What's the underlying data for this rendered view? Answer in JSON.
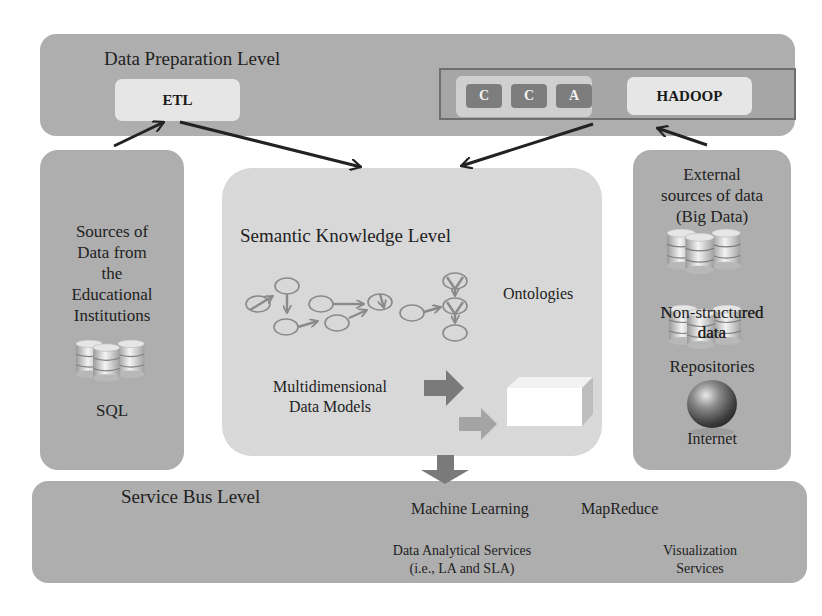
{
  "diagram": {
    "data_preparation": {
      "title": "Data Preparation Level",
      "etl_label": "ETL",
      "cca_chips": [
        "C",
        "C",
        "A"
      ],
      "hadoop_label": "HADOOP"
    },
    "left_source": {
      "title_lines": [
        "Sources of",
        "Data from",
        "the",
        "Educational",
        "Institutions"
      ],
      "icon": "database-stack-icon",
      "label": "SQL"
    },
    "semantic": {
      "title": "Semantic Knowledge Level",
      "ontologies_label": "Ontologies",
      "ontology_icon": "ontology-graph-icon",
      "models_lines": [
        "Multidimensional",
        "Data Models"
      ],
      "cube_icon": "data-cube-icon"
    },
    "right_source": {
      "title_lines": [
        "External",
        "sources of data",
        "(Big Data)"
      ],
      "items": [
        {
          "icon": "database-stack-icon",
          "label_lines": [
            "Non-structured",
            "data"
          ]
        },
        {
          "icon": "database-stack-icon",
          "label_lines": [
            "Repositories"
          ]
        },
        {
          "icon": "globe-icon",
          "label_lines": [
            "Internet"
          ]
        }
      ]
    },
    "service_bus": {
      "title": "Service Bus Level",
      "machine_learning": "Machine Learning",
      "mapreduce": "MapReduce",
      "analytics_lines": [
        "Data Analytical Services",
        "(i.e., LA and SLA)"
      ],
      "visualization_lines": [
        "Visualization",
        "Services"
      ]
    },
    "colors": {
      "panel_dark": "#aeaeae",
      "panel_light": "#d8d8d8",
      "box_light": "#e6e6e6",
      "chip": "#7d7d7d",
      "arrow": "#222222",
      "block_arrow": "#7a7a7a",
      "graph_stroke": "#8a8a8a"
    }
  }
}
